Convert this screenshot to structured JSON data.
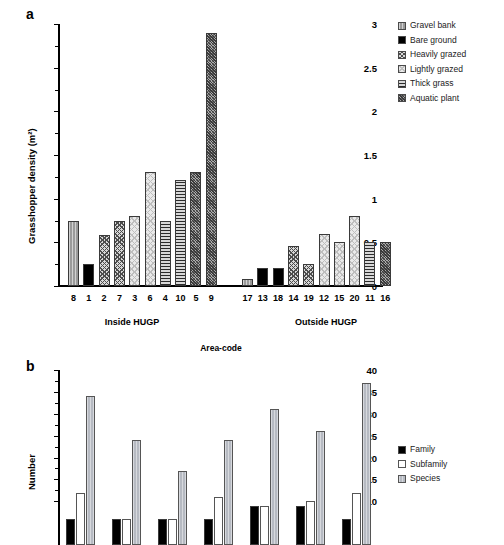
{
  "figure": {
    "panel_a_letter": "a",
    "panel_b_letter": "b"
  },
  "panel_a": {
    "ylabel": "Grasshopper density (m²)",
    "xlabel": "Area-code",
    "group_inside": "Inside HUGP",
    "group_outside": "Outside HUGP",
    "ytick_labels": [
      "0",
      "0.5",
      "1",
      "1.5",
      "2",
      "2.5",
      "3"
    ],
    "legend": [
      {
        "label": "Gravel bank",
        "fill": "f-gravel"
      },
      {
        "label": "Bare ground",
        "fill": "f-bare"
      },
      {
        "label": "Heavily grazed",
        "fill": "f-heavy"
      },
      {
        "label": "Lightly grazed",
        "fill": "f-light"
      },
      {
        "label": "Thick grass",
        "fill": "f-thick"
      },
      {
        "label": "Aquatic plant",
        "fill": "f-aquatic"
      }
    ]
  },
  "panel_b": {
    "ylabel": "Number",
    "ytick_labels": [
      "10",
      "15",
      "20",
      "25",
      "30",
      "35",
      "40"
    ],
    "legend": [
      {
        "label": "Family",
        "fill": "f-family"
      },
      {
        "label": "Subfamily",
        "fill": "f-subfamily"
      },
      {
        "label": "Species",
        "fill": "f-species"
      }
    ]
  },
  "chart_data": [
    {
      "type": "bar",
      "panel": "a",
      "title": "",
      "xlabel": "Area-code",
      "ylabel": "Grasshopper density (m²)",
      "ylim": [
        0,
        3
      ],
      "yticks": [
        0,
        0.5,
        1,
        1.5,
        2,
        2.5,
        3
      ],
      "grid": false,
      "legend_position": "right",
      "legend_entries": [
        "Gravel bank",
        "Bare ground",
        "Heavily grazed",
        "Lightly grazed",
        "Thick grass",
        "Aquatic plant"
      ],
      "groups": [
        "Inside HUGP",
        "Outside HUGP"
      ],
      "categories": [
        "8",
        "1",
        "2",
        "7",
        "3",
        "6",
        "4",
        "10",
        "5",
        "9",
        "17",
        "13",
        "18",
        "14",
        "19",
        "12",
        "15",
        "20",
        "11",
        "16"
      ],
      "values": [
        0.75,
        0.25,
        0.58,
        0.75,
        0.8,
        1.3,
        0.75,
        1.21,
        1.3,
        2.9,
        0.08,
        0.21,
        0.21,
        0.46,
        0.25,
        0.59,
        0.5,
        0.8,
        0.5,
        0.5
      ],
      "habitat": [
        "Gravel bank",
        "Bare ground",
        "Heavily grazed",
        "Heavily grazed",
        "Lightly grazed",
        "Lightly grazed",
        "Thick grass",
        "Thick grass",
        "Aquatic plant",
        "Aquatic plant",
        "Gravel bank",
        "Bare ground",
        "Bare ground",
        "Heavily grazed",
        "Heavily grazed",
        "Lightly grazed",
        "Lightly grazed",
        "Lightly grazed",
        "Thick grass",
        "Aquatic plant"
      ],
      "group_membership": [
        "Inside HUGP",
        "Inside HUGP",
        "Inside HUGP",
        "Inside HUGP",
        "Inside HUGP",
        "Inside HUGP",
        "Inside HUGP",
        "Inside HUGP",
        "Inside HUGP",
        "Inside HUGP",
        "Outside HUGP",
        "Outside HUGP",
        "Outside HUGP",
        "Outside HUGP",
        "Outside HUGP",
        "Outside HUGP",
        "Outside HUGP",
        "Outside HUGP",
        "Outside HUGP",
        "Outside HUGP"
      ]
    },
    {
      "type": "bar",
      "panel": "b",
      "title": "",
      "xlabel": "",
      "ylabel": "Number",
      "ylim": [
        0,
        40
      ],
      "yticks": [
        10,
        15,
        20,
        25,
        30,
        35,
        40
      ],
      "grid": false,
      "legend_position": "right",
      "categories": [
        "1",
        "2",
        "3",
        "4",
        "5",
        "6",
        "7"
      ],
      "series": [
        {
          "name": "Family",
          "values": [
            6,
            6,
            6,
            6,
            9,
            9,
            6
          ]
        },
        {
          "name": "Subfamily",
          "values": [
            12,
            6,
            6,
            11,
            9,
            10,
            12
          ]
        },
        {
          "name": "Species",
          "values": [
            34,
            24,
            17,
            24,
            31,
            26,
            37
          ]
        }
      ]
    }
  ]
}
